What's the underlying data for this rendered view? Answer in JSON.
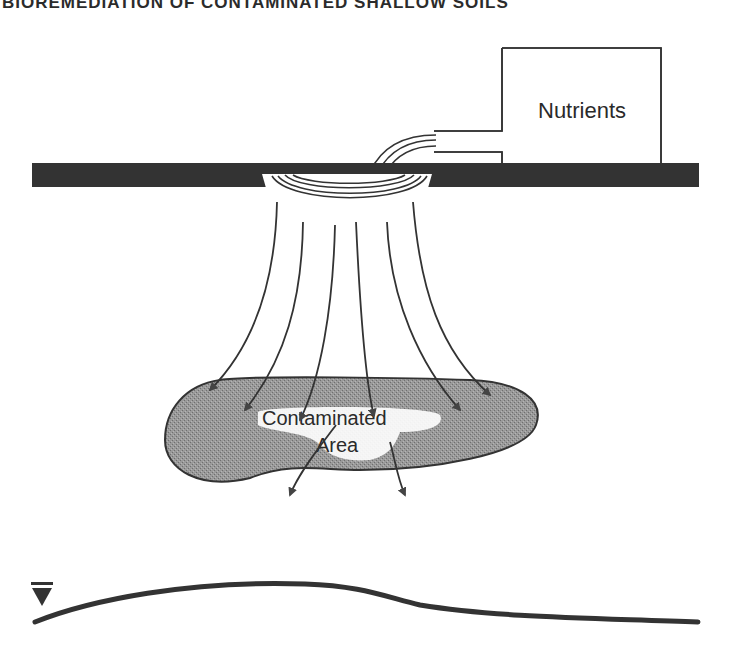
{
  "header": {
    "running_title": "BIOREMEDIATION OF CONTAMINATED SHALLOW SOILS"
  },
  "diagram": {
    "tank": {
      "label": "Nutrients",
      "icon": "tank-icon"
    },
    "ground_surface": {
      "icon": "ground-surface-icon",
      "color": "#333333"
    },
    "infiltration_gallery": {
      "icon": "infiltration-gallery-icon"
    },
    "flow_arrows": {
      "count": 7,
      "icon": "arrow-down-icon"
    },
    "contaminated_zone": {
      "label_line1": "Contaminated",
      "label_line2": "Area",
      "fill_color": "#8a8a8a"
    },
    "water_table": {
      "icon": "water-table-symbol-icon"
    }
  }
}
